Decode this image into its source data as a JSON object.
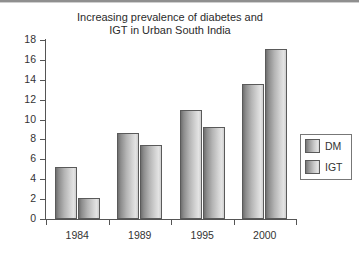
{
  "chart_data": {
    "type": "bar",
    "title": "Increasing prevalence of diabetes and IGT in Urban South India",
    "title_line1": "Increasing prevalence of diabetes and",
    "title_line2": "IGT in Urban South India",
    "xlabel": "",
    "ylabel": "Percentage",
    "ylim": [
      0,
      18
    ],
    "yticks": [
      0,
      2,
      4,
      6,
      8,
      10,
      12,
      14,
      16,
      18
    ],
    "ytick_labels": [
      "0",
      "2",
      "4",
      "6",
      "8",
      "10",
      "12",
      "14",
      "16",
      "18"
    ],
    "categories": [
      "1984",
      "1989",
      "1995",
      "2000"
    ],
    "grid": false,
    "legend_position": "right",
    "series": [
      {
        "name": "DM",
        "values": [
          5.2,
          8.6,
          11.0,
          13.6
        ],
        "color": "#b4b4b4"
      },
      {
        "name": "IGT",
        "values": [
          2.1,
          7.4,
          9.25,
          17.1
        ],
        "color": "#b4b4b4"
      }
    ]
  },
  "legend": {
    "items": [
      {
        "label": "DM"
      },
      {
        "label": "IGT"
      }
    ]
  }
}
